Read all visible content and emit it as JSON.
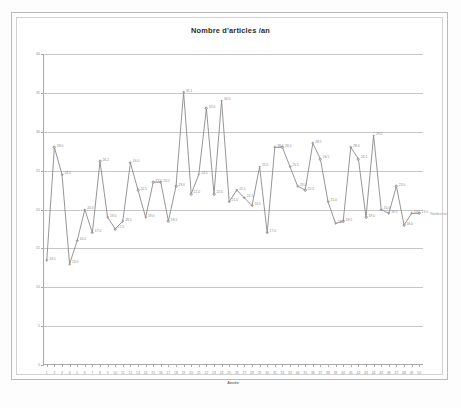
{
  "chart_data": {
    "type": "line",
    "title": "Nombre d'articles /an",
    "xlabel": "Année",
    "ylabel": "",
    "series_name": "Nombre/an",
    "grid": true,
    "legend_position": "end-of-line",
    "xlim": [
      1,
      50
    ],
    "ylim": [
      0,
      40
    ],
    "ytick_labels": [
      "0",
      "5",
      "10",
      "15",
      "20",
      "25",
      "30",
      "35",
      "40"
    ],
    "ytick_values": [
      0,
      5,
      10,
      15,
      20,
      25,
      30,
      35,
      40
    ],
    "categories": [
      1,
      2,
      3,
      4,
      5,
      6,
      7,
      8,
      9,
      10,
      11,
      12,
      13,
      14,
      15,
      16,
      17,
      18,
      19,
      20,
      21,
      22,
      23,
      24,
      25,
      26,
      27,
      28,
      29,
      30,
      31,
      32,
      33,
      34,
      35,
      36,
      37,
      38,
      39,
      40,
      41,
      42,
      43,
      44,
      45,
      46,
      47,
      48,
      49,
      50
    ],
    "values": [
      13.5,
      28.0,
      24.5,
      13.0,
      16.0,
      20.0,
      17.0,
      26.2,
      19.0,
      17.5,
      18.5,
      26.0,
      22.5,
      19.0,
      23.5,
      23.5,
      18.5,
      23.0,
      35.1,
      22.0,
      24.5,
      33.0,
      22.0,
      34.0,
      21.0,
      22.5,
      21.5,
      20.5,
      25.5,
      17.0,
      28.0,
      28.0,
      25.5,
      23.0,
      22.5,
      28.5,
      26.5,
      21.0,
      18.2,
      18.5,
      28.0,
      26.5,
      19.0,
      29.5,
      20.0,
      19.5,
      23.0,
      18.0,
      19.5,
      19.5
    ],
    "point_labels": [
      "13.5",
      "28.0",
      "24.5",
      "13.0",
      "16.0",
      "20.0",
      "17.0",
      "26.2",
      "19.0",
      "17.5",
      "18.5",
      "26.0",
      "22.5",
      "19.0",
      "23.5",
      "23.5",
      "18.5",
      "23.0",
      "35.1",
      "22.0",
      "24.5",
      "33.0",
      "22.0",
      "34.0",
      "21.0",
      "22.5",
      "21.5",
      "20.5",
      "25.5",
      "17.0",
      "28.0",
      "28.0",
      "25.5",
      "23.0",
      "22.5",
      "28.5",
      "26.5",
      "21.0",
      "18.2",
      "18.5",
      "28.0",
      "26.5",
      "19.0",
      "29.5",
      "20.0",
      "19.5",
      "23.0",
      "18.0",
      "19.5",
      "19.5"
    ],
    "colors": {
      "line": "#8a8a8a",
      "marker_edge": "#8a8a8a",
      "marker_fill": "#ffffff",
      "grid": "#c6c6c6",
      "axis": "#a9a9a9",
      "title_text": "#2b2b2b",
      "tick_text": "#8d8d8d",
      "label_text": "#8a8a8a"
    }
  }
}
